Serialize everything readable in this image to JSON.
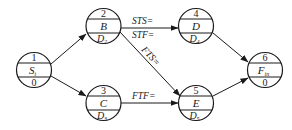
{
  "diagram": {
    "type": "precedence-network",
    "colors": {
      "stroke": "#1a1a1a",
      "background": "#ffffff"
    },
    "nodes": [
      {
        "id": "1",
        "number": "1",
        "name": "S",
        "name_sub": "t",
        "duration": "0",
        "duration_sub": "",
        "cx": 34,
        "cy": 70
      },
      {
        "id": "2",
        "number": "2",
        "name": "B",
        "name_sub": "",
        "duration": "D",
        "duration_sub": "2",
        "cx": 103.5,
        "cy": 26
      },
      {
        "id": "3",
        "number": "3",
        "name": "C",
        "name_sub": "",
        "duration": "D",
        "duration_sub": "3",
        "cx": 103.5,
        "cy": 103
      },
      {
        "id": "4",
        "number": "4",
        "name": "D",
        "name_sub": "",
        "duration": "D",
        "duration_sub": "4",
        "cx": 196,
        "cy": 26
      },
      {
        "id": "5",
        "number": "5",
        "name": "E",
        "name_sub": "",
        "duration": "D",
        "duration_sub": "5",
        "cx": 196,
        "cy": 103
      },
      {
        "id": "6",
        "number": "6",
        "name": "F",
        "name_sub": "in",
        "duration": "0",
        "duration_sub": "",
        "cx": 265,
        "cy": 70
      }
    ],
    "edges": [
      {
        "from": "1",
        "to": "2",
        "label": ""
      },
      {
        "from": "1",
        "to": "3",
        "label": ""
      },
      {
        "from": "2",
        "to": "4",
        "label": "STS=",
        "label2": "STF="
      },
      {
        "from": "2",
        "to": "5",
        "label": "FTS="
      },
      {
        "from": "3",
        "to": "5",
        "label": "FTF="
      },
      {
        "from": "4",
        "to": "6",
        "label": ""
      },
      {
        "from": "5",
        "to": "6",
        "label": ""
      }
    ]
  }
}
